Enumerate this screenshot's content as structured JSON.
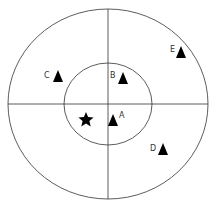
{
  "diagram": {
    "outer_circle": {
      "cx": 108,
      "cy": 104,
      "rx": 100,
      "ry": 95
    },
    "inner_circle": {
      "cx": 108,
      "cy": 104,
      "rx": 44,
      "ry": 41
    },
    "axes": {
      "h_y": 104,
      "v_x": 108
    },
    "markers": [
      {
        "label": "A",
        "shape": "triangle",
        "x": 113,
        "y": 121,
        "lx": 120,
        "ly": 118
      },
      {
        "label": "B",
        "shape": "triangle",
        "x": 123,
        "y": 79,
        "lx": 111,
        "ly": 77
      },
      {
        "label": "C",
        "shape": "triangle",
        "x": 58,
        "y": 77,
        "lx": 45,
        "ly": 77
      },
      {
        "label": "D",
        "shape": "triangle",
        "x": 163,
        "y": 150,
        "lx": 151,
        "ly": 150
      },
      {
        "label": "E",
        "shape": "triangle",
        "x": 181,
        "y": 52,
        "lx": 171,
        "ly": 51
      }
    ],
    "star": {
      "x": 86,
      "y": 119
    },
    "colors": {
      "line": "#333333",
      "marker": "#000000"
    }
  }
}
